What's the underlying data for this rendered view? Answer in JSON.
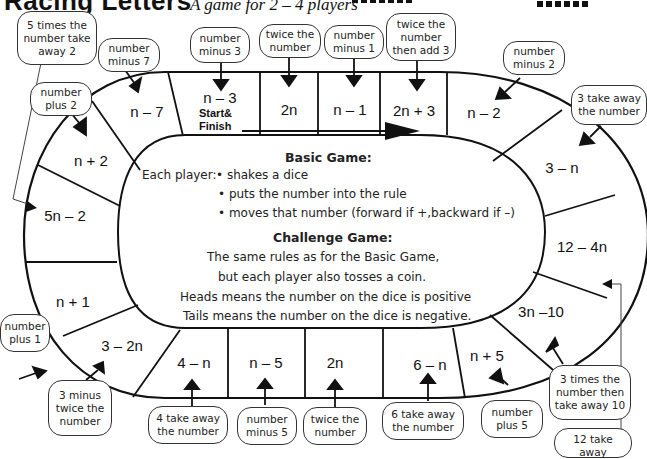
{
  "header": {
    "title": "Racing Letters",
    "subtitle": "A game for 2 – 4 players",
    "dice_label": "dice"
  },
  "board": {
    "start_label_line1": "Start&",
    "start_label_line2": "Finish",
    "cells": [
      {
        "id": "c1",
        "expr": "n – 3",
        "hint": "number minus 3"
      },
      {
        "id": "c2",
        "expr": "2n",
        "hint": "twice the number"
      },
      {
        "id": "c3",
        "expr": "n – 1",
        "hint": "number minus 1"
      },
      {
        "id": "c4",
        "expr": "2n + 3",
        "hint": "twice the number then add 3"
      },
      {
        "id": "c5",
        "expr": "n – 2",
        "hint": "number minus 2"
      },
      {
        "id": "c6",
        "expr": "3 – n",
        "hint": "3 take away the number"
      },
      {
        "id": "c7",
        "expr": "12 – 4n",
        "hint": "12 take away"
      },
      {
        "id": "c8",
        "expr": "3n –10",
        "hint": "3 times the number then take away 10"
      },
      {
        "id": "c9",
        "expr": "n + 5",
        "hint": "number plus 5"
      },
      {
        "id": "c10",
        "expr": "6 – n",
        "hint": "6 take away the number"
      },
      {
        "id": "c11",
        "expr": "2n",
        "hint": "twice the number"
      },
      {
        "id": "c12",
        "expr": "n – 5",
        "hint": "number minus 5"
      },
      {
        "id": "c13",
        "expr": "4 – n",
        "hint": "4 take away the number"
      },
      {
        "id": "c14",
        "expr": "3 – 2n",
        "hint": "3 minus twice the number"
      },
      {
        "id": "c15",
        "expr": "n + 1",
        "hint": "number plus 1"
      },
      {
        "id": "c16",
        "expr": "5n – 2",
        "hint": "5 times the number take away 2"
      },
      {
        "id": "c17",
        "expr": "n + 2",
        "hint": "number plus 2"
      },
      {
        "id": "c18",
        "expr": "n – 7",
        "hint": "number minus 7"
      }
    ]
  },
  "bubbles": {
    "b_5times": "5 times the number take away 2",
    "b_minus7": "number minus 7",
    "b_plus2": "number plus 2",
    "b_minus3": "number minus 3",
    "b_twice_top": "twice the number",
    "b_minus1": "number minus 1",
    "b_twice_add3": "twice the number then add 3",
    "b_minus2": "number minus 2",
    "b_3take": "3 take away the number",
    "b_plus1": "number plus 1",
    "b_3minus2": "3 minus twice the number",
    "b_4take": "4 take away the number",
    "b_minus5": "number minus 5",
    "b_twice_bot": "twice the number",
    "b_6take": "6 take away the number",
    "b_plus5": "number plus 5",
    "b_3times": "3 times the number then take away 10",
    "b_12take": "12 take away"
  },
  "rules": {
    "basic_title": "Basic Game:",
    "each_player": "Each player:",
    "basic_steps": [
      "• shakes a dice",
      "• puts the number into the rule",
      "• moves that number (forward if +,backward if –)"
    ],
    "challenge_title": "Challenge Game:",
    "challenge_lines": [
      "The same rules as for the Basic Game,",
      "but each player also tosses a coin.",
      "Heads means the number on the dice is positive",
      "Tails means the number on the dice is negative."
    ]
  }
}
